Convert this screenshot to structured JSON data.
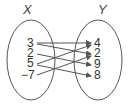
{
  "diagram": {
    "type": "mapping-diagram",
    "domain_label": "X",
    "range_label": "Y",
    "domain": [
      "3",
      "2",
      "5",
      "−7"
    ],
    "range": [
      "4",
      "2",
      "9",
      "8"
    ],
    "mappings": [
      {
        "from": "3",
        "to": "4"
      },
      {
        "from": "3",
        "to": "2"
      },
      {
        "from": "2",
        "to": "9"
      },
      {
        "from": "5",
        "to": "4"
      },
      {
        "from": "5",
        "to": "8"
      },
      {
        "from": "−7",
        "to": "2"
      }
    ],
    "colors": {
      "stroke": "#555555",
      "text": "#333333"
    }
  }
}
